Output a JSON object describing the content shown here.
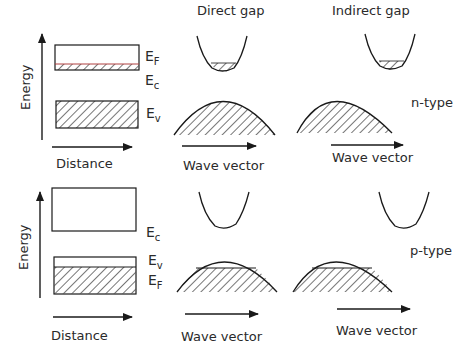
{
  "columns": {
    "direct": "Direct gap",
    "indirect": "Indirect gap"
  },
  "rows": {
    "n_type": {
      "label": "n-type",
      "axis_y": "Energy",
      "axis_x": "Distance",
      "levels": {
        "top": "E",
        "top_sub": "F",
        "mid": "E",
        "mid_sub": "c",
        "low": "E",
        "low_sub": "v"
      },
      "direct_axis": "Wave vector",
      "indirect_axis": "Wave vector"
    },
    "p_type": {
      "label": "p-type",
      "axis_y": "Energy",
      "axis_x": "Distance",
      "levels": {
        "top": "E",
        "top_sub": "c",
        "mid": "E",
        "mid_sub": "v",
        "low": "E",
        "low_sub": "F"
      },
      "direct_axis": "Wave vector",
      "indirect_axis": "Wave vector"
    }
  },
  "colors": {
    "line": "#1a1a1a",
    "fermi_line_n": "#b04040"
  }
}
